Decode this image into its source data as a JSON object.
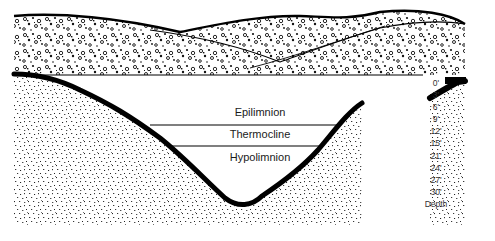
{
  "diagram": {
    "layers": [
      {
        "name": "epilimnion",
        "label": "Epilimnion"
      },
      {
        "name": "thermocline",
        "label": "Thermocline"
      },
      {
        "name": "hypolimnion",
        "label": "Hypolimnion"
      }
    ],
    "depth_scale": {
      "title": "Depth",
      "ticks": [
        "0'",
        "3'",
        "6'",
        "9'",
        "12'",
        "15'",
        "21'",
        "24'",
        "27'",
        "30'"
      ]
    },
    "colors": {
      "outline": "#000000",
      "background": "#ffffff",
      "text": "#1a1a1a"
    }
  }
}
